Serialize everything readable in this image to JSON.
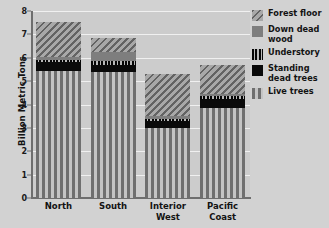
{
  "chart_data": {
    "type": "bar",
    "subtype": "stacked-bar",
    "title": "",
    "xlabel": "",
    "ylabel": "Billion Metric Tons",
    "ylim": [
      0,
      8
    ],
    "yticks": [
      0,
      1,
      2,
      3,
      4,
      5,
      6,
      7,
      8
    ],
    "ytick_labels": [
      "0",
      "1",
      "2",
      "3",
      "4",
      "5",
      "6",
      "7",
      "8"
    ],
    "grid": true,
    "legend_position": "right",
    "categories": [
      "North",
      "South",
      "Interior West",
      "Pacific Coast"
    ],
    "category_lines": [
      [
        "North"
      ],
      [
        "South"
      ],
      [
        "Interior",
        "West"
      ],
      [
        "Pacific",
        "Coast"
      ]
    ],
    "series": [
      {
        "name": "Live trees",
        "pattern": "vertical-stripes",
        "color": "#6f6f6f",
        "values": [
          5.45,
          5.4,
          3.0,
          3.85
        ]
      },
      {
        "name": "Standing dead trees",
        "pattern": "solid-black",
        "color": "#0a0a0a",
        "values": [
          0.35,
          0.3,
          0.3,
          0.4
        ]
      },
      {
        "name": "Understory",
        "pattern": "fine-vertical-ticks",
        "color": "#0a0a0a",
        "values": [
          0.1,
          0.15,
          0.1,
          0.1
        ]
      },
      {
        "name": "Down dead wood",
        "pattern": "solid-gray",
        "color": "#7e7e7e",
        "values": [
          0.15,
          0.4,
          0.1,
          0.1
        ]
      },
      {
        "name": "Forest floor",
        "pattern": "diagonal-hatch",
        "color": "#8a8a8a",
        "values": [
          1.5,
          0.6,
          1.8,
          1.25
        ]
      }
    ],
    "totals": [
      7.55,
      6.85,
      5.3,
      5.7
    ],
    "stack_order_bottom_to_top": [
      "Live trees",
      "Standing dead trees",
      "Understory",
      "Down dead wood",
      "Forest floor"
    ],
    "legend_order_top_to_bottom": [
      "Forest floor",
      "Down dead wood",
      "Understory",
      "Standing dead trees",
      "Live trees"
    ],
    "legend_entries": [
      {
        "label": "Forest floor",
        "lines": [
          "Forest floor"
        ],
        "swatch": "diagonal-hatch"
      },
      {
        "label": "Down dead wood",
        "lines": [
          "Down dead",
          "wood"
        ],
        "swatch": "solid-gray"
      },
      {
        "label": "Understory",
        "lines": [
          "Understory"
        ],
        "swatch": "fine-vertical-ticks"
      },
      {
        "label": "Standing dead trees",
        "lines": [
          "Standing",
          "dead trees"
        ],
        "swatch": "solid-black"
      },
      {
        "label": "Live trees",
        "lines": [
          "Live trees"
        ],
        "swatch": "vertical-stripes"
      }
    ]
  },
  "colors": {
    "background": "#d2d2d2",
    "plot_background": "#cccccc",
    "gridline": "#f0f0f0",
    "axis": "#6e6e6e",
    "text": "#131313"
  }
}
